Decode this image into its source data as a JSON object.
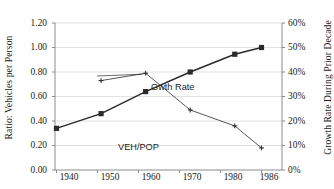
{
  "chart_data": {
    "type": "line",
    "title": "",
    "xlabel": "",
    "categories": [
      "1940",
      "1950",
      "1960",
      "1970",
      "1980",
      "1986"
    ],
    "x": [
      1940,
      1950,
      1960,
      1970,
      1980,
      1986
    ],
    "grid": true,
    "legend_position": "inline-annotations",
    "axes": {
      "left": {
        "label": "Ratio: Vehicles per Person",
        "ylim": [
          0.0,
          1.2
        ],
        "ticks": [
          0.0,
          0.2,
          0.4,
          0.6,
          0.8,
          1.0,
          1.2
        ],
        "tick_labels": [
          "0.00",
          "0.20",
          "0.40",
          "0.60",
          "0.80",
          "1.00",
          "1.20"
        ]
      },
      "right": {
        "label": "Growth Rate During Prior Decade",
        "ylim": [
          0,
          60
        ],
        "ticks": [
          0,
          10,
          20,
          30,
          40,
          50,
          60
        ],
        "tick_labels": [
          "0%",
          "10%",
          "20%",
          "30%",
          "40%",
          "50%",
          "60%"
        ]
      }
    },
    "series": [
      {
        "name": "VEH/POP",
        "axis": "left",
        "marker": "square",
        "values": [
          0.34,
          0.46,
          0.64,
          0.8,
          0.945,
          1.0
        ]
      },
      {
        "name": "Gwth Rate",
        "axis": "right",
        "marker": "plus",
        "values": [
          null,
          36.5,
          39.5,
          24.5,
          18.0,
          9.0
        ]
      }
    ],
    "annotations": [
      {
        "text": "Gwth Rate",
        "series": "Gwth Rate"
      },
      {
        "text": "VEH/POP",
        "series": "VEH/POP"
      }
    ],
    "colors": {
      "series_line": "#2b2b2b",
      "gridline": "#d9d9d9",
      "axis": "#808080",
      "background": "#ffffff"
    }
  }
}
